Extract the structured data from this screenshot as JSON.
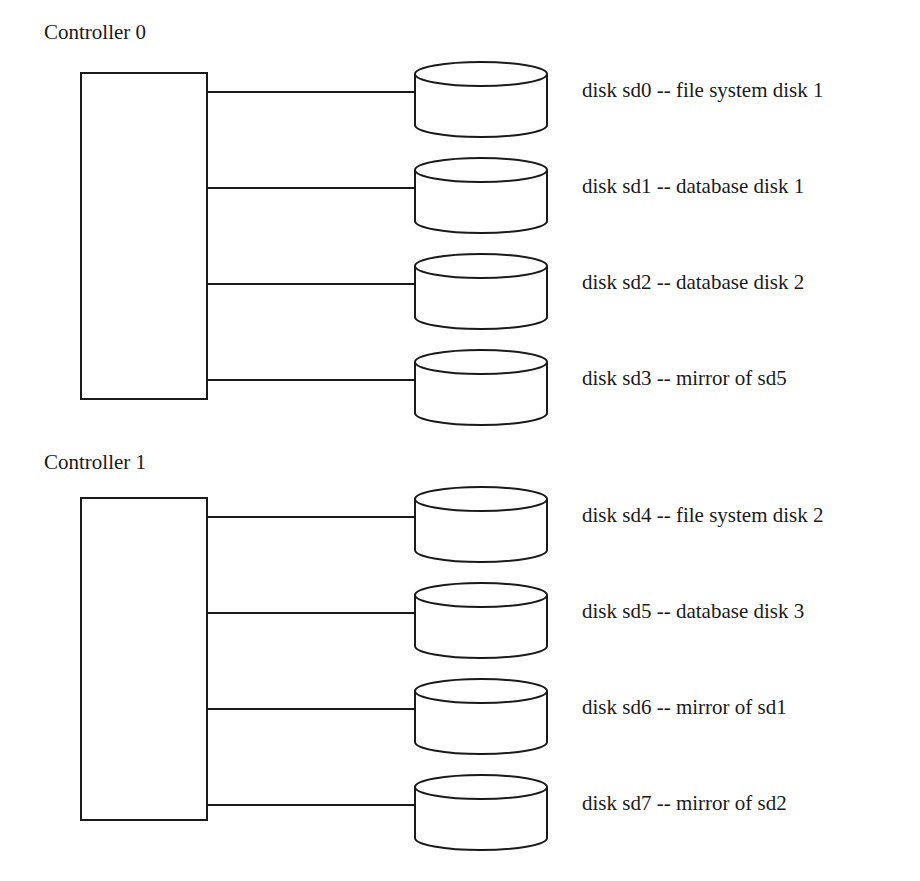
{
  "controllers": [
    {
      "label": "Controller 0",
      "label_pos": {
        "x": 44,
        "y": 22
      },
      "box": {
        "x": 81,
        "y": 73,
        "w": 126,
        "h": 326
      },
      "disks": [
        {
          "name": "sd0",
          "label": "disk sd0 -- file system disk 1",
          "y": 92
        },
        {
          "name": "sd1",
          "label": "disk sd1 -- database disk 1",
          "y": 188
        },
        {
          "name": "sd2",
          "label": "disk sd2 -- database disk 2",
          "y": 284
        },
        {
          "name": "sd3",
          "label": "disk sd3 -- mirror of sd5",
          "y": 380
        }
      ]
    },
    {
      "label": "Controller 1",
      "label_pos": {
        "x": 44,
        "y": 452
      },
      "box": {
        "x": 81,
        "y": 498,
        "w": 126,
        "h": 322
      },
      "disks": [
        {
          "name": "sd4",
          "label": "disk sd4 -- file system disk 2",
          "y": 517
        },
        {
          "name": "sd5",
          "label": "disk sd5 -- database disk 3",
          "y": 613
        },
        {
          "name": "sd6",
          "label": "disk sd6 -- mirror of sd1",
          "y": 709
        },
        {
          "name": "sd7",
          "label": "disk sd7 -- mirror of sd2",
          "y": 805
        }
      ]
    }
  ],
  "colors": {
    "stroke": "#1a1a1a",
    "background": "#ffffff"
  }
}
